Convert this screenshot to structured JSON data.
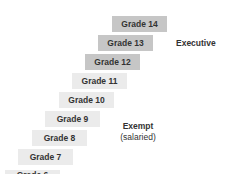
{
  "diagram": {
    "type": "staircase",
    "grades": [
      {
        "label": "Grade 14",
        "band": "executive"
      },
      {
        "label": "Grade 13",
        "band": "executive"
      },
      {
        "label": "Grade 12",
        "band": "executive"
      },
      {
        "label": "Grade 11",
        "band": "exempt"
      },
      {
        "label": "Grade 10",
        "band": "exempt"
      },
      {
        "label": "Grade 9",
        "band": "exempt"
      },
      {
        "label": "Grade 8",
        "band": "exempt"
      },
      {
        "label": "Grade 7",
        "band": "exempt"
      },
      {
        "label": "Grade 6",
        "band": "exempt",
        "partially_visible": true
      }
    ],
    "bands": {
      "executive": {
        "label": "Executive",
        "color": "#c6c6c6"
      },
      "exempt": {
        "label": "Exempt",
        "sublabel": "(salaried)",
        "color": "#ebebeb"
      }
    }
  }
}
